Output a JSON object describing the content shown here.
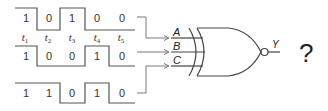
{
  "diagram": {
    "type": "logic-gate-timing",
    "gate": "XNOR",
    "inputs": [
      {
        "name": "A",
        "bits": [
          "1",
          "0",
          "1",
          "0",
          "0"
        ]
      },
      {
        "name": "B",
        "bits": [
          "1",
          "0",
          "0",
          "1",
          "0"
        ]
      },
      {
        "name": "C",
        "bits": [
          "1",
          "1",
          "0",
          "1",
          "0"
        ]
      }
    ],
    "time_labels": [
      {
        "letter": "t",
        "sub": "1"
      },
      {
        "letter": "t",
        "sub": "2"
      },
      {
        "letter": "t",
        "sub": "3"
      },
      {
        "letter": "t",
        "sub": "4"
      },
      {
        "letter": "t",
        "sub": "5"
      }
    ],
    "output_label": "Y",
    "question_mark": "?",
    "colors": {
      "waveform": "#555555",
      "connector": "#7a7a7a",
      "gate": "#444444",
      "text": "#333333"
    }
  }
}
